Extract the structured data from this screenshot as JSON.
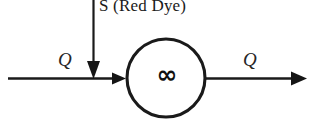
{
  "diagram": {
    "canvas": {
      "width": 310,
      "height": 124,
      "background": "#ffffff"
    },
    "stroke_color": "#1a1a1a",
    "labels": {
      "source": "S (Red Dye)",
      "inflow_rate": "Q",
      "outflow_rate": "Q",
      "vessel_symbol": "∞"
    },
    "geometry": {
      "flow_line_y": 78,
      "flow_line_start_x": 8,
      "flow_line_end_x": 306,
      "inlet_arrow_tip_x": 126,
      "vessel_center_x": 166,
      "vessel_center_y": 78,
      "vessel_radius": 40,
      "source_arrow_x": 93,
      "source_arrow_top_y": 0,
      "source_arrow_tip_y": 78
    }
  }
}
